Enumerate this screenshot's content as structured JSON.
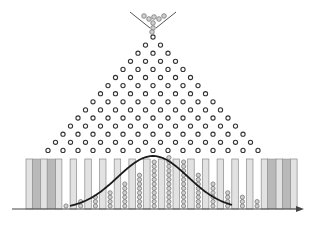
{
  "colors": {
    "background": "#ffffff",
    "peg_stroke": "#333333",
    "ball_fill": "#d0d0d0",
    "ball_stroke": "#777777",
    "pillar_fill": "#e2e2e2",
    "pillar_stroke": "#8a8a8a",
    "empty_bin_fill": "#b9b9b9",
    "curve": "#1a1a1a",
    "axis": "#444444",
    "funnel": "#555555"
  },
  "funnel": {
    "apex_x": 153,
    "left_top": [
      130,
      12
    ],
    "right_top": [
      176,
      12
    ],
    "left_bottom": [
      150,
      28
    ],
    "right_bottom": [
      156,
      28
    ],
    "balls": [
      [
        144,
        16
      ],
      [
        149,
        19
      ],
      [
        154,
        17
      ],
      [
        159,
        19
      ],
      [
        164,
        16
      ],
      [
        153,
        23
      ],
      [
        153,
        28
      ],
      [
        152,
        32
      ]
    ]
  },
  "pegs": {
    "rows": 15,
    "top_x": 153,
    "top_y": 37,
    "dx": 15,
    "dy": 8.1,
    "radius": 2.1
  },
  "bins": {
    "top_y": 159,
    "bottom_y": 209,
    "first_pillar_x": 26,
    "pitch": 14.7,
    "pillar_width": 6.5,
    "count": 18,
    "ball_counts": [
      0,
      0,
      1,
      2,
      3,
      4,
      6,
      8,
      11,
      12,
      11,
      8,
      6,
      4,
      3,
      2,
      0,
      0
    ],
    "empty_shaded": [
      0,
      1,
      16,
      17
    ]
  },
  "curve": {
    "mean_x": 153,
    "sigma": 35,
    "peak_y": 156,
    "baseline_y": 209,
    "x_start": 70,
    "x_end": 232
  },
  "axis": {
    "y": 209,
    "x_start": 12,
    "x_end": 304,
    "arrow": "right-arrow"
  }
}
